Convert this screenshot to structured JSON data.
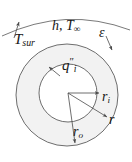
{
  "figure": {
    "canvas": {
      "width": 132,
      "height": 162
    },
    "stroke_color": "#5a5a5a",
    "fill_color": "#f2f2f2",
    "text_color": "#161616"
  },
  "labels": {
    "surroundings_temp": {
      "symbol": "T",
      "sub": "sur",
      "sup": ""
    },
    "convection": {
      "symbol": "h, T",
      "sub": "∞",
      "sup": ""
    },
    "emissivity": {
      "symbol": "ε",
      "sub": "",
      "sup": ""
    },
    "inner_heat_flux": {
      "symbol": "q",
      "sub": "i",
      "sup": "″"
    },
    "inner_radius": {
      "symbol": "r",
      "sub": "i",
      "sup": ""
    },
    "radius": {
      "symbol": "r",
      "sub": "",
      "sup": ""
    },
    "outer_radius": {
      "symbol": "r",
      "sub": "o",
      "sup": ""
    }
  },
  "geometry": {
    "outer_circle": {
      "cx": 67,
      "cy": 95,
      "r": 51
    },
    "inner_circle": {
      "cx": 68,
      "cy": 93,
      "r": 29
    },
    "center_point": {
      "x": 68,
      "y": 93
    },
    "surroundings_arc": "M 2 36 Q 66 6 130 30",
    "arrows": [
      {
        "name": "tsur-arrow",
        "x1": 14,
        "y1": 38,
        "x2": 19,
        "y2": 22
      },
      {
        "name": "emissivity-arrow",
        "x1": 106,
        "y1": 36,
        "x2": 112,
        "y2": 51
      },
      {
        "name": "inner-flux-arrow",
        "x1": 60,
        "y1": 76,
        "x2": 49,
        "y2": 67
      },
      {
        "name": "inner-radius-arrow",
        "x1": 68,
        "y1": 93,
        "x2": 100,
        "y2": 93
      },
      {
        "name": "radius-arrow",
        "x1": 68,
        "y1": 93,
        "x2": 108,
        "y2": 118
      },
      {
        "name": "outer-radius-arrow",
        "x1": 68,
        "y1": 93,
        "x2": 75,
        "y2": 144
      }
    ]
  }
}
